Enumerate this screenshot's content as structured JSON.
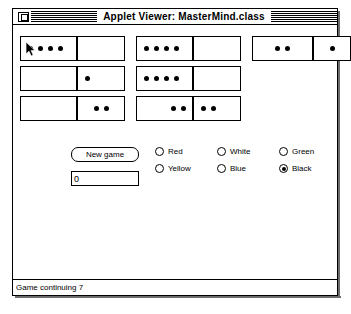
{
  "window": {
    "title": "Applet Viewer: MasterMind.class",
    "close_box": "close-box",
    "status": "Game continuing 7"
  },
  "board": {
    "rows": [
      {
        "pairs": [
          {
            "guess_pegs": 4,
            "guess_align": "left",
            "guess_cursor": true,
            "score_pegs": 0,
            "score_align": "center",
            "score_present": true
          },
          {
            "guess_pegs": 4,
            "guess_align": "left",
            "guess_cursor": false,
            "score_pegs": 0,
            "score_align": "center",
            "score_present": true
          },
          {
            "guess_pegs": 2,
            "guess_align": "center",
            "guess_cursor": false,
            "score_pegs": 1,
            "score_align": "center",
            "score_present": true
          }
        ]
      },
      {
        "pairs": [
          {
            "guess_pegs": 0,
            "guess_align": "center",
            "guess_cursor": false,
            "score_pegs": 1,
            "score_align": "left",
            "score_present": true
          },
          {
            "guess_pegs": 4,
            "guess_align": "left",
            "guess_cursor": false,
            "score_pegs": 0,
            "score_align": "center",
            "score_present": true
          },
          {
            "guess_pegs": 0,
            "guess_align": "center",
            "guess_cursor": false,
            "score_pegs": 0,
            "score_align": "center",
            "score_present": false
          }
        ]
      },
      {
        "pairs": [
          {
            "guess_pegs": 0,
            "guess_align": "center",
            "guess_cursor": false,
            "score_pegs": 2,
            "score_align": "center",
            "score_present": true
          },
          {
            "guess_pegs": 2,
            "guess_align": "right",
            "guess_cursor": false,
            "score_pegs": 2,
            "score_align": "left",
            "score_present": true
          },
          {
            "guess_pegs": 0,
            "guess_align": "center",
            "guess_cursor": false,
            "score_pegs": 0,
            "score_align": "center",
            "score_present": false
          }
        ]
      }
    ]
  },
  "controls": {
    "new_game_label": "New game",
    "guess_input_value": "0",
    "guess_input_placeholder": "",
    "colors": [
      {
        "label": "Red",
        "selected": false
      },
      {
        "label": "White",
        "selected": false
      },
      {
        "label": "Green",
        "selected": false
      },
      {
        "label": "Yellow",
        "selected": false
      },
      {
        "label": "Blue",
        "selected": false
      },
      {
        "label": "Black",
        "selected": true
      }
    ]
  },
  "cursor": {
    "name": "mouse-pointer"
  }
}
